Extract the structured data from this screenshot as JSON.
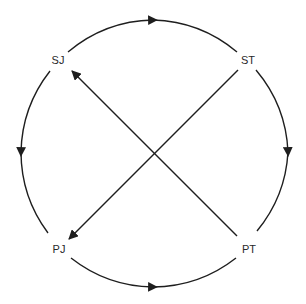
{
  "diagram": {
    "type": "cycle-with-cross-arrows",
    "colors": {
      "line": "#1e1e1e",
      "text": "#2a2a2a",
      "background": "#ffffff"
    },
    "nodes": [
      {
        "id": "SJ",
        "label": "SJ",
        "position": "top-left"
      },
      {
        "id": "ST",
        "label": "ST",
        "position": "top-right"
      },
      {
        "id": "PT",
        "label": "PT",
        "position": "bottom-right"
      },
      {
        "id": "PJ",
        "label": "PJ",
        "position": "bottom-left"
      }
    ],
    "edges": [
      {
        "from": "SJ",
        "to": "ST",
        "kind": "arc",
        "side": "top"
      },
      {
        "from": "ST",
        "to": "PT",
        "kind": "arc",
        "side": "right"
      },
      {
        "from": "SJ",
        "to": "PJ",
        "kind": "arc",
        "side": "left"
      },
      {
        "from": "PJ",
        "to": "PT",
        "kind": "arc",
        "side": "bottom"
      },
      {
        "from": "PT",
        "to": "SJ",
        "kind": "straight",
        "side": "diagonal"
      },
      {
        "from": "ST",
        "to": "PJ",
        "kind": "straight",
        "side": "diagonal"
      }
    ]
  }
}
